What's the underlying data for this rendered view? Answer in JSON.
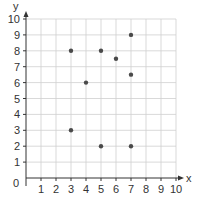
{
  "chart_data": {
    "type": "scatter",
    "title": "",
    "xlabel": "x",
    "ylabel": "y",
    "xlim": [
      0,
      10
    ],
    "ylim": [
      0,
      10
    ],
    "grid": true,
    "legend": null,
    "x_ticks": [
      1,
      2,
      3,
      4,
      5,
      6,
      7,
      8,
      9,
      10
    ],
    "y_ticks": [
      1,
      2,
      3,
      4,
      5,
      6,
      7,
      8,
      9,
      10
    ],
    "origin_label": "0",
    "series": [
      {
        "name": "points",
        "points": [
          {
            "x": 3,
            "y": 8
          },
          {
            "x": 3,
            "y": 3
          },
          {
            "x": 4,
            "y": 6
          },
          {
            "x": 5,
            "y": 8
          },
          {
            "x": 5,
            "y": 2
          },
          {
            "x": 6,
            "y": 7.5
          },
          {
            "x": 7,
            "y": 9
          },
          {
            "x": 7,
            "y": 6.5
          },
          {
            "x": 7,
            "y": 2
          }
        ]
      }
    ]
  },
  "colors": {
    "grid": "#cfcfcf",
    "axis": "#333333",
    "point": "#4a4a4a",
    "text": "#333333"
  }
}
